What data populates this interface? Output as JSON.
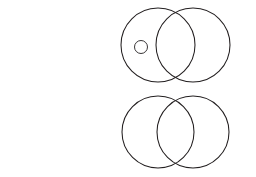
{
  "figure": {
    "background_color": "#ffffff",
    "stroke_color": "#231f20",
    "text_color": "#231f20"
  },
  "captions": {
    "top": {
      "full_text": "No P are B.",
      "segments": [
        {
          "text": "No ",
          "italic": false
        },
        {
          "text": "P",
          "italic": true
        },
        {
          "text": " are ",
          "italic": false
        },
        {
          "text": "B",
          "italic": true
        },
        {
          "text": ".",
          "italic": false
        }
      ]
    },
    "bottom": {
      "full_text": "It is false that all P are B.",
      "line1": "It is false that",
      "line2_segments": [
        {
          "text": "all ",
          "italic": false
        },
        {
          "text": "P",
          "italic": true
        },
        {
          "text": " are ",
          "italic": false
        },
        {
          "text": "B",
          "italic": true
        },
        {
          "text": ".",
          "italic": false
        }
      ]
    }
  },
  "diagrams": [
    {
      "id": "top-venn",
      "left_circle_label": "P",
      "right_circle_label": "B",
      "mark": "X",
      "mark_style": "circled-x",
      "mark_region": "left-only",
      "intersection_shading": "horizontal-hatch",
      "hatch_line_count": 17,
      "geometry": {
        "left_cx": 158,
        "right_cx": 193,
        "cy": 45,
        "r": 37,
        "label_left_x": 120,
        "label_left_y": 76,
        "label_right_x": 231,
        "label_right_y": 76,
        "mark_x": 141,
        "mark_y": 47,
        "mark_circle_r": 6.5
      }
    },
    {
      "id": "bottom-venn",
      "left_circle_label": "P",
      "right_circle_label": "B",
      "mark": "X",
      "mark_style": "plain-x",
      "mark_region": "left-only",
      "intersection_shading": "none",
      "hatch_line_count": 0,
      "geometry": {
        "left_cx": 158,
        "right_cx": 193,
        "cy": 132,
        "r": 36,
        "label_left_x": 120,
        "label_left_y": 162,
        "label_right_x": 232,
        "label_right_y": 162,
        "mark_x": 141,
        "mark_y": 131,
        "mark_circle_r": 0
      }
    }
  ]
}
